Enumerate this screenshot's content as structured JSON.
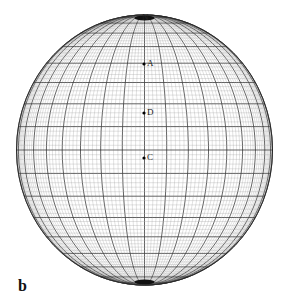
{
  "figure": {
    "panel_label": "b",
    "pole_label": "N",
    "points": [
      {
        "label": "A",
        "x": 144,
        "y": 64
      },
      {
        "label": "D",
        "x": 144,
        "y": 113
      },
      {
        "label": "C",
        "x": 144,
        "y": 158
      }
    ],
    "colors": {
      "line": "#222222",
      "fine": "#888888",
      "background": "#ffffff"
    }
  }
}
